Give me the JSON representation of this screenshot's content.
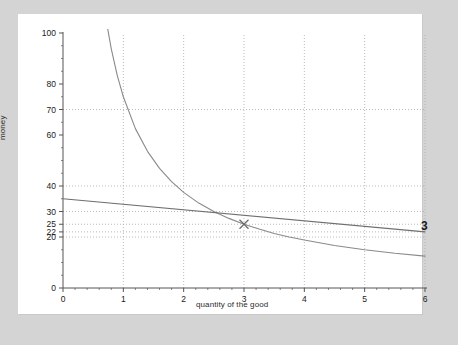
{
  "chart_data": {
    "type": "line",
    "title": "",
    "xlabel": "quantity of the good",
    "ylabel": "money",
    "xlim": [
      0,
      6
    ],
    "ylim": [
      0,
      100
    ],
    "grid": true,
    "grid_style": "dotted",
    "legend": "none",
    "xticks": [
      0,
      1,
      2,
      3,
      4,
      5,
      6
    ],
    "xtick_labels": [
      "0",
      "1",
      "2",
      "3",
      "4",
      "5",
      "6"
    ],
    "yticks": [
      0,
      20,
      22,
      25,
      30,
      40,
      60,
      70,
      80,
      100
    ],
    "ytick_labels": [
      "0",
      "20",
      "22",
      "25",
      "30",
      "40",
      "60",
      "70",
      "80",
      "100"
    ],
    "hlines": [
      20,
      22,
      25,
      30,
      40,
      70
    ],
    "vlines": [
      1,
      2,
      3,
      4,
      5,
      6
    ],
    "series": [
      {
        "name": "demand-curve",
        "kind": "hyperbola",
        "color": "#8a8a8a",
        "x": [
          0.7,
          0.8,
          0.9,
          1.0,
          1.2,
          1.4,
          1.6,
          1.8,
          2.0,
          2.25,
          2.5,
          2.75,
          3.0,
          3.25,
          3.5,
          3.75,
          4.0,
          4.5,
          5.0,
          5.5,
          6.0
        ],
        "y": [
          107.1,
          93.8,
          83.3,
          75.0,
          62.5,
          53.6,
          46.9,
          41.7,
          37.5,
          33.3,
          30.0,
          27.3,
          25.0,
          23.1,
          21.4,
          20.0,
          18.8,
          16.7,
          15.0,
          13.6,
          12.5
        ]
      },
      {
        "name": "supply-line",
        "kind": "line",
        "color": "#6f6f6f",
        "x": [
          0,
          6
        ],
        "y": [
          35,
          22
        ]
      }
    ],
    "markers": [
      {
        "name": "equilibrium-marker",
        "symbol": "x",
        "x": 3.0,
        "y": 25.0,
        "color": "#6b6b6b"
      }
    ],
    "annotations": [
      {
        "name": "equilibrium-value-label",
        "text": "3",
        "x": 6.0,
        "y": 22.0
      }
    ]
  },
  "labels": {
    "ylabel": "money",
    "xlabel": "quantity of the good",
    "eq_label": "3"
  },
  "colors": {
    "page_background": "#d4d4d4",
    "paper": "#ffffff",
    "axis": "#555555",
    "grid": "#aaaaaa",
    "curve": "#8a8a8a",
    "line": "#6f6f6f",
    "text": "#1a1a1a"
  }
}
